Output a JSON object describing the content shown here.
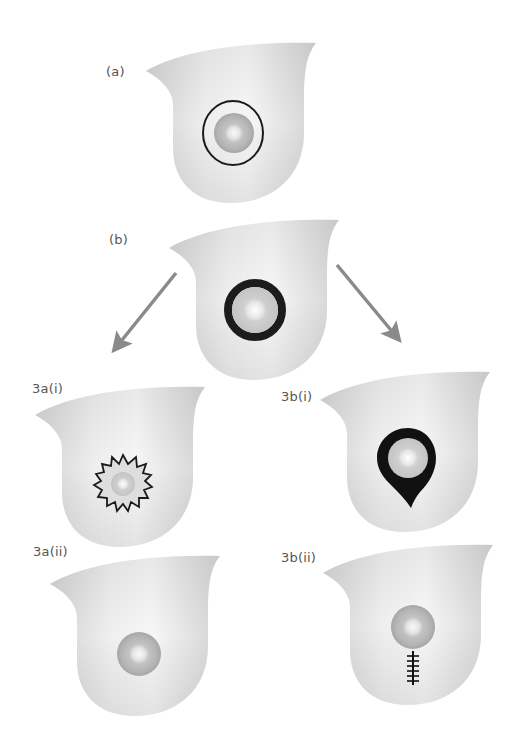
{
  "labels": {
    "a": "(a)",
    "b": "(b)",
    "a_i": "3a(i)",
    "b_i": "3b(i)",
    "a_ii": "3a(ii)",
    "b_ii": "3b(ii)"
  },
  "colors": {
    "background": "#ffffff",
    "breast_fill_light": "#f6f6f6",
    "breast_fill_dark": "#cfcfcf",
    "nipple_outer": "#a9a9a9",
    "nipple_inner": "#efefef",
    "outline": "#1a1a1a",
    "arrow": "#8a8a8a",
    "label_text": "#555555"
  },
  "panels": [
    {
      "id": "a",
      "marker": "thin-ring",
      "description": "Breast with thin circular margin around nipple-areola"
    },
    {
      "id": "b",
      "marker": "thick-ring",
      "description": "Breast with thick dark ring around nipple-areola"
    },
    {
      "id": "3a(i)",
      "marker": "spiky-star",
      "description": "Irregular spiky margin around nipple-areola"
    },
    {
      "id": "3b(i)",
      "marker": "teardrop",
      "description": "Teardrop-shaped excision around nipple-areola"
    },
    {
      "id": "3a(ii)",
      "marker": "none",
      "description": "Healed breast with nipple-areola only"
    },
    {
      "id": "3b(ii)",
      "marker": "vertical-scar",
      "description": "Nipple-areola with vertical sutured scar below"
    }
  ],
  "arrows": [
    {
      "from": "b",
      "to": "3a(i)",
      "direction": "down-left"
    },
    {
      "from": "b",
      "to": "3b(i)",
      "direction": "down-right"
    }
  ]
}
